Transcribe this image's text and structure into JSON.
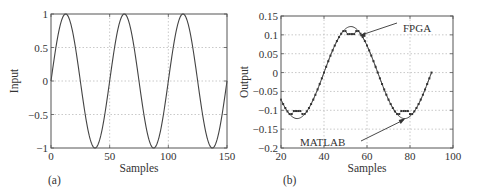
{
  "chart_data": [
    {
      "id": "a",
      "type": "line",
      "panel_label": "(a)",
      "title": "",
      "xlabel": "Samples",
      "ylabel": "Input",
      "xlim": [
        0,
        150
      ],
      "ylim": [
        -1,
        1
      ],
      "xticks": [
        0,
        50,
        100,
        150
      ],
      "yticks": [
        -1,
        -0.5,
        0,
        0.5,
        1
      ],
      "xtick_labels": [
        "0",
        "50",
        "100",
        "150"
      ],
      "ytick_labels": [
        "−1",
        "−0.5",
        "0",
        "0.5",
        "1"
      ],
      "grid": true,
      "series": [
        {
          "name": "Input",
          "function": "sin(2*pi*n/50)",
          "period_samples": 50,
          "amplitude": 1,
          "x": [
            0,
            12.5,
            25,
            37.5,
            50,
            62.5,
            75,
            87.5,
            100,
            112.5,
            125,
            137.5,
            150
          ],
          "values": [
            0,
            1,
            0,
            -1,
            0,
            1,
            0,
            -1,
            0,
            1,
            0,
            -1,
            0
          ]
        }
      ]
    },
    {
      "id": "b",
      "type": "line",
      "panel_label": "(b)",
      "title": "",
      "xlabel": "Samples",
      "ylabel": "Output",
      "xlim": [
        20,
        100
      ],
      "ylim": [
        -0.2,
        0.15
      ],
      "xticks": [
        20,
        40,
        60,
        80,
        100
      ],
      "yticks": [
        -0.2,
        -0.15,
        -0.1,
        -0.05,
        0,
        0.05,
        0.1,
        0.15
      ],
      "xtick_labels": [
        "20",
        "40",
        "60",
        "80",
        "100"
      ],
      "ytick_labels": [
        "−0.2",
        "−0.15",
        "−0.1",
        "−0.05",
        "0",
        "0.05",
        "0.1",
        "0.15"
      ],
      "grid": true,
      "annotations": [
        {
          "text": "FPGA",
          "arrow_to": [
            56,
            0.105
          ]
        },
        {
          "text": "MATLAB",
          "arrow_to": [
            78,
            -0.115
          ]
        }
      ],
      "series": [
        {
          "name": "MATLAB",
          "style": "solid",
          "x": [
            20,
            27.5,
            40,
            52.5,
            65,
            77.5,
            90
          ],
          "values": [
            -0.075,
            -0.122,
            0,
            0.122,
            0,
            -0.122,
            0
          ]
        },
        {
          "name": "FPGA",
          "style": "dotted-markers",
          "x": [
            20,
            24,
            27,
            31,
            40,
            49,
            52,
            55,
            59,
            65,
            74,
            77,
            80,
            84,
            90
          ],
          "values": [
            -0.075,
            -0.11,
            -0.105,
            -0.11,
            0,
            0.11,
            0.105,
            0.11,
            0.09,
            0,
            -0.11,
            -0.105,
            -0.11,
            -0.09,
            0
          ]
        }
      ]
    }
  ]
}
